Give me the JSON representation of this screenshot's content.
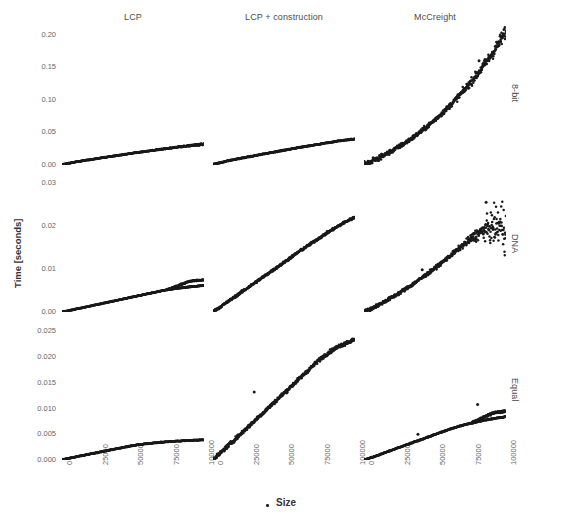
{
  "figure": {
    "axis_titles": {
      "y": "Time [seconds]",
      "x": "Size"
    },
    "col_titles": [
      "LCP",
      "LCP + construction",
      "McCreight"
    ],
    "row_titles": [
      "8-bit",
      "DNA",
      "Equal"
    ],
    "x_ticks": [
      "0",
      "25000",
      "50000",
      "75000",
      "100000"
    ],
    "x_tick_values": [
      0,
      25000,
      50000,
      75000,
      100000
    ],
    "y_ticks_rows": [
      [
        "0.00",
        "0.05",
        "0.10",
        "0.15",
        "0.20"
      ],
      [
        "0.00",
        "0.01",
        "0.02",
        "0.03"
      ],
      [
        "0.000",
        "0.005",
        "0.010",
        "0.015",
        "0.020",
        "0.025"
      ]
    ],
    "point_color": "#1a1a1a",
    "text_color": "#4d4d4d",
    "background": "#ffffff"
  },
  "chart_data": {
    "type": "scatter",
    "title": "",
    "xlabel": "Size",
    "ylabel": "Time [seconds]",
    "facet_columns": [
      "LCP",
      "LCP + construction",
      "McCreight"
    ],
    "facet_rows": [
      "8-bit",
      "DNA",
      "Equal"
    ],
    "xlim": [
      0,
      100000
    ],
    "grid": false,
    "legend": "none",
    "marker": "filled-circle",
    "panels": [
      {
        "row": "8-bit",
        "col": "LCP",
        "ylim": [
          0.0,
          0.215
        ],
        "yticks": [
          0.0,
          0.05,
          0.1,
          0.15,
          0.2
        ],
        "shape": "slightly-superlinear-band",
        "x": [
          1000,
          5000,
          10000,
          15000,
          20000,
          25000,
          30000,
          35000,
          40000,
          45000,
          50000,
          55000,
          60000,
          65000,
          70000,
          75000,
          80000,
          85000,
          90000,
          95000,
          100000
        ],
        "y": [
          0.001,
          0.0028,
          0.0048,
          0.0066,
          0.0083,
          0.01,
          0.0117,
          0.0134,
          0.015,
          0.0166,
          0.0182,
          0.0198,
          0.0213,
          0.0228,
          0.0243,
          0.0257,
          0.0271,
          0.0285,
          0.0297,
          0.0308,
          0.0318
        ],
        "noise": 0.0008
      },
      {
        "row": "8-bit",
        "col": "LCP + construction",
        "ylim": [
          0.0,
          0.215
        ],
        "yticks": [
          0.0,
          0.05,
          0.1,
          0.15,
          0.2
        ],
        "shape": "near-linear-band",
        "x": [
          1000,
          5000,
          10000,
          15000,
          20000,
          25000,
          30000,
          35000,
          40000,
          45000,
          50000,
          55000,
          60000,
          65000,
          70000,
          75000,
          80000,
          85000,
          90000,
          95000,
          100000
        ],
        "y": [
          0.0012,
          0.0035,
          0.006,
          0.0083,
          0.0104,
          0.0125,
          0.0146,
          0.0167,
          0.0187,
          0.0207,
          0.0227,
          0.0247,
          0.0266,
          0.0285,
          0.0303,
          0.0321,
          0.0339,
          0.0356,
          0.0372,
          0.0387,
          0.04
        ],
        "noise": 0.0011
      },
      {
        "row": "8-bit",
        "col": "McCreight",
        "ylim": [
          0.0,
          0.215
        ],
        "yticks": [
          0.0,
          0.05,
          0.1,
          0.15,
          0.2
        ],
        "shape": "strongly-superlinear-curve",
        "x": [
          1000,
          5000,
          10000,
          15000,
          20000,
          25000,
          30000,
          35000,
          40000,
          45000,
          50000,
          55000,
          60000,
          65000,
          70000,
          75000,
          80000,
          85000,
          90000,
          95000,
          100000
        ],
        "y": [
          0.0015,
          0.0055,
          0.0105,
          0.016,
          0.022,
          0.0285,
          0.0355,
          0.043,
          0.0512,
          0.06,
          0.0695,
          0.0795,
          0.09,
          0.1015,
          0.1135,
          0.1265,
          0.14,
          0.1545,
          0.17,
          0.187,
          0.206
        ],
        "noise": 0.006,
        "outliers": [
          {
            "x": 81000,
            "y": 0.16
          },
          {
            "x": 73000,
            "y": 0.1235
          }
        ]
      },
      {
        "row": "DNA",
        "col": "LCP",
        "ylim": [
          0.0,
          0.0325
        ],
        "yticks": [
          0.0,
          0.01,
          0.02,
          0.03
        ],
        "shape": "linear-band-splitting-two-branches",
        "x": [
          1000,
          5000,
          10000,
          15000,
          20000,
          25000,
          30000,
          35000,
          40000,
          45000,
          50000,
          55000,
          60000,
          65000,
          70000,
          75000,
          80000,
          85000,
          90000,
          95000,
          100000
        ],
        "y": [
          8e-05,
          0.00035,
          0.0007,
          0.00105,
          0.0014,
          0.00175,
          0.0021,
          0.00245,
          0.0028,
          0.00315,
          0.0035,
          0.00385,
          0.0042,
          0.00455,
          0.0049,
          0.0052,
          0.00545,
          0.00565,
          0.00585,
          0.006,
          0.00615
        ],
        "branch_split_x": 74000,
        "branch_upper_offset": 0.0013,
        "noise": 0.00012
      },
      {
        "row": "DNA",
        "col": "LCP + construction",
        "ylim": [
          0.0,
          0.0325
        ],
        "yticks": [
          0.0,
          0.01,
          0.02,
          0.03
        ],
        "shape": "linear-band",
        "x": [
          1000,
          5000,
          10000,
          15000,
          20000,
          25000,
          30000,
          35000,
          40000,
          45000,
          50000,
          55000,
          60000,
          65000,
          70000,
          75000,
          80000,
          85000,
          90000,
          95000,
          100000
        ],
        "y": [
          0.00025,
          0.00115,
          0.0023,
          0.00345,
          0.0046,
          0.00575,
          0.0069,
          0.00805,
          0.0092,
          0.01035,
          0.0115,
          0.0127,
          0.0139,
          0.015,
          0.0161,
          0.0172,
          0.0183,
          0.0193,
          0.0203,
          0.0212,
          0.022
        ],
        "noise": 0.0005
      },
      {
        "row": "DNA",
        "col": "McCreight",
        "ylim": [
          0.0,
          0.0325
        ],
        "yticks": [
          0.0,
          0.01,
          0.02,
          0.03
        ],
        "shape": "superlinear-curve-with-heavy-right-scatter",
        "x": [
          1000,
          5000,
          10000,
          15000,
          20000,
          25000,
          30000,
          35000,
          40000,
          45000,
          50000,
          55000,
          60000,
          65000,
          70000,
          75000,
          80000,
          85000,
          90000,
          95000,
          100000
        ],
        "y": [
          0.00015,
          0.00075,
          0.0016,
          0.0025,
          0.00345,
          0.00445,
          0.0055,
          0.0066,
          0.00775,
          0.00895,
          0.0102,
          0.0115,
          0.01285,
          0.0142,
          0.0156,
          0.0169,
          0.0181,
          0.019,
          0.0196,
          0.02,
          0.0203
        ],
        "noise": 0.0007,
        "right_scatter_from_x": 62000,
        "right_scatter_amp": 0.003,
        "outliers": [
          {
            "x": 86000,
            "y": 0.0255
          },
          {
            "x": 41000,
            "y": 0.0098
          }
        ]
      },
      {
        "row": "Equal",
        "col": "LCP",
        "ylim": [
          0.0,
          0.0272
        ],
        "yticks": [
          0.0,
          0.005,
          0.01,
          0.015,
          0.02,
          0.025
        ],
        "shape": "flat-linear-band",
        "x": [
          1000,
          5000,
          10000,
          15000,
          20000,
          25000,
          30000,
          35000,
          40000,
          45000,
          50000,
          55000,
          60000,
          65000,
          70000,
          75000,
          80000,
          85000,
          90000,
          95000,
          100000
        ],
        "y": [
          0.00012,
          0.00035,
          0.00062,
          0.0009,
          0.00118,
          0.00145,
          0.00172,
          0.002,
          0.00228,
          0.00255,
          0.00282,
          0.003,
          0.00318,
          0.00332,
          0.00345,
          0.00355,
          0.00365,
          0.00372,
          0.0038,
          0.00386,
          0.00392
        ],
        "noise": 0.00012
      },
      {
        "row": "Equal",
        "col": "LCP + construction",
        "ylim": [
          0.0,
          0.0272
        ],
        "yticks": [
          0.0,
          0.005,
          0.01,
          0.015,
          0.02,
          0.025
        ],
        "shape": "steep-linear-band",
        "x": [
          1000,
          5000,
          10000,
          15000,
          20000,
          25000,
          30000,
          35000,
          40000,
          45000,
          50000,
          55000,
          60000,
          65000,
          70000,
          75000,
          80000,
          85000,
          90000,
          95000,
          100000
        ],
        "y": [
          0.00025,
          0.0013,
          0.0026,
          0.0039,
          0.0052,
          0.0065,
          0.0078,
          0.0091,
          0.0104,
          0.0117,
          0.013,
          0.0143,
          0.0156,
          0.0169,
          0.0182,
          0.0195,
          0.0206,
          0.0215,
          0.0223,
          0.0229,
          0.0234
        ],
        "noise": 0.00065,
        "outliers": [
          {
            "x": 29000,
            "y": 0.0132
          }
        ]
      },
      {
        "row": "Equal",
        "col": "McCreight",
        "ylim": [
          0.0,
          0.0272
        ],
        "yticks": [
          0.0,
          0.005,
          0.01,
          0.015,
          0.02,
          0.025
        ],
        "shape": "linear-band-splitting-right",
        "x": [
          1000,
          5000,
          10000,
          15000,
          20000,
          25000,
          30000,
          35000,
          40000,
          45000,
          50000,
          55000,
          60000,
          65000,
          70000,
          75000,
          80000,
          85000,
          90000,
          95000,
          100000
        ],
        "y": [
          0.0001,
          0.00045,
          0.00095,
          0.00145,
          0.00195,
          0.00245,
          0.00295,
          0.00345,
          0.00395,
          0.00445,
          0.00495,
          0.00545,
          0.00595,
          0.0064,
          0.0068,
          0.00715,
          0.00745,
          0.00775,
          0.008,
          0.0082,
          0.0084
        ],
        "branch_split_x": 76000,
        "branch_upper_offset": 0.0011,
        "noise": 0.00015,
        "outliers": [
          {
            "x": 80000,
            "y": 0.0108
          },
          {
            "x": 38000,
            "y": 0.005
          }
        ]
      }
    ]
  }
}
